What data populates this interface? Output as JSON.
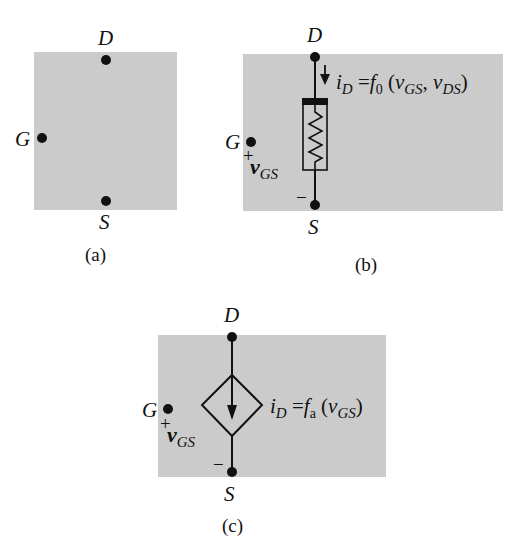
{
  "figure": {
    "panels": [
      {
        "id": "a",
        "caption": "(a)",
        "terminals": {
          "drain": "D",
          "gate": "G",
          "source": "S"
        }
      },
      {
        "id": "b",
        "caption": "(b)",
        "terminals": {
          "drain": "D",
          "gate": "G",
          "source": "S"
        },
        "element": "nonlinear-resistor",
        "control_voltage": {
          "plus": "+",
          "minus": "−",
          "symbol": "v",
          "subscript": "GS"
        },
        "equation": {
          "lhs": "i",
          "lhs_sub": "D",
          "eq": "=",
          "func": "f",
          "func_sub": "0",
          "open": "(",
          "arg1": "v",
          "arg1_sub": "GS",
          "comma": ",",
          "arg2": "v",
          "arg2_sub": "DS",
          "close": ")"
        }
      },
      {
        "id": "c",
        "caption": "(c)",
        "terminals": {
          "drain": "D",
          "gate": "G",
          "source": "S"
        },
        "element": "dependent-current-source",
        "control_voltage": {
          "plus": "+",
          "minus": "−",
          "symbol": "v",
          "subscript": "GS"
        },
        "equation": {
          "lhs": "i",
          "lhs_sub": "D",
          "eq": "=",
          "func": "f",
          "func_sub": "a",
          "open": "(",
          "arg1": "v",
          "arg1_sub": "GS",
          "close": ")"
        }
      }
    ],
    "colors": {
      "panel_fill": "#cbcbcb",
      "ink": "#111111"
    }
  }
}
